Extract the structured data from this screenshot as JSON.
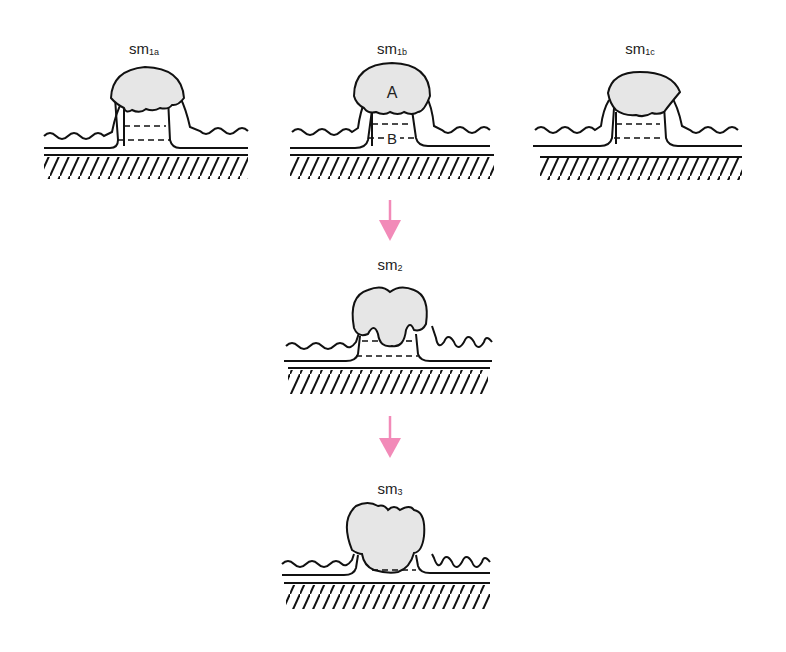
{
  "colors": {
    "arrow": "#f28ab8",
    "fill": "#e8e8e8",
    "stroke": "#111111"
  },
  "states": [
    {
      "id": "sm1a",
      "base": "sm",
      "sub": "1a"
    },
    {
      "id": "sm1b",
      "base": "sm",
      "sub": "1b",
      "labels": {
        "upper": "A",
        "lower": "B"
      }
    },
    {
      "id": "sm1c",
      "base": "sm",
      "sub": "1c"
    },
    {
      "id": "sm2",
      "base": "sm",
      "sub": "2"
    },
    {
      "id": "sm3",
      "base": "sm",
      "sub": "3"
    }
  ],
  "arrows": [
    {
      "from": "sm1b",
      "to": "sm2"
    },
    {
      "from": "sm2",
      "to": "sm3"
    }
  ]
}
